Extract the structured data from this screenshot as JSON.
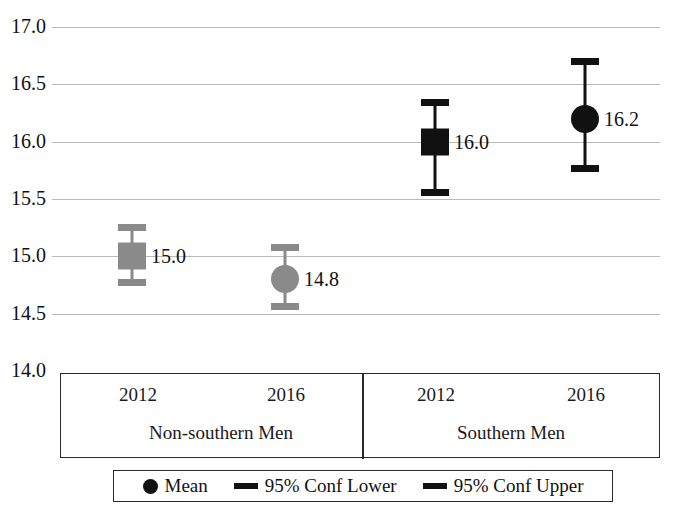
{
  "chart_data": {
    "type": "scatter",
    "title": "",
    "xlabel": "",
    "ylabel": "",
    "ylim": [
      14.0,
      17.0
    ],
    "grid": true,
    "legend_position": "bottom",
    "yticks": [
      "17.0",
      "16.5",
      "16.0",
      "15.5",
      "15.0",
      "14.5",
      "14.0"
    ],
    "ytick_values": [
      17.0,
      16.5,
      16.0,
      15.5,
      15.0,
      14.5,
      14.0
    ],
    "categories": [
      "2012",
      "2016",
      "2012",
      "2016"
    ],
    "groups": [
      {
        "label": "Non-southern Men",
        "categories": [
          "2012",
          "2016"
        ]
      },
      {
        "label": "Southern Men",
        "categories": [
          "2012",
          "2016"
        ]
      }
    ],
    "points": [
      {
        "group": "Non-southern Men",
        "category": "2012",
        "mean": 15.0,
        "label": "15.0",
        "conf_lower": 14.78,
        "conf_upper": 15.26,
        "marker": "square",
        "color": "#8a8a8a"
      },
      {
        "group": "Non-southern Men",
        "category": "2016",
        "mean": 14.8,
        "label": "14.8",
        "conf_lower": 14.57,
        "conf_upper": 15.08,
        "marker": "circle",
        "color": "#8a8a8a"
      },
      {
        "group": "Southern Men",
        "category": "2012",
        "mean": 16.0,
        "label": "16.0",
        "conf_lower": 15.56,
        "conf_upper": 16.35,
        "marker": "square",
        "color": "#111111"
      },
      {
        "group": "Southern Men",
        "category": "2016",
        "mean": 16.2,
        "label": "16.2",
        "conf_lower": 15.77,
        "conf_upper": 16.7,
        "marker": "circle",
        "color": "#111111"
      }
    ],
    "legend": [
      {
        "label": "Mean",
        "symbol": "dot",
        "color": "#111111"
      },
      {
        "label": "95% Conf Lower",
        "symbol": "bar",
        "color": "#111111"
      },
      {
        "label": "95% Conf Upper",
        "symbol": "bar",
        "color": "#111111"
      }
    ]
  }
}
